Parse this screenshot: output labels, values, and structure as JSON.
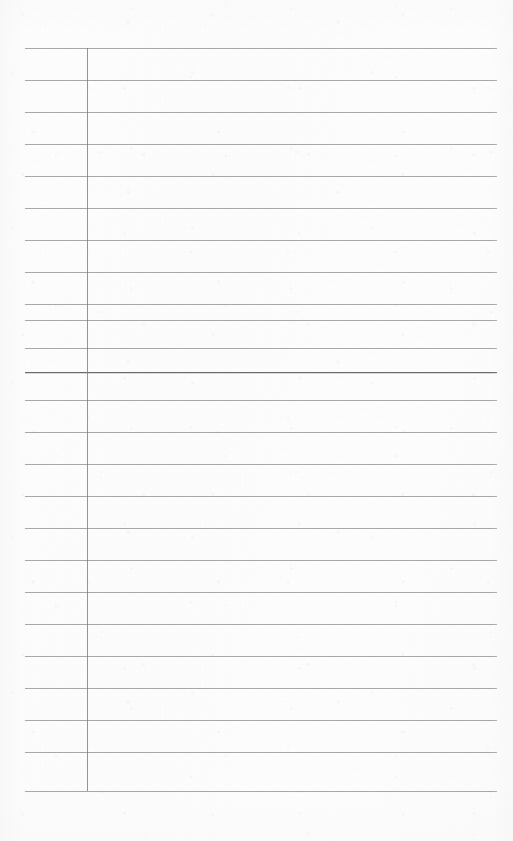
{
  "document": {
    "kind": "lined-ledger-page",
    "title": "",
    "content_text": "",
    "page_width": 513,
    "page_height": 841,
    "background_color": "#fdfdfd"
  },
  "ruling": {
    "line_color": "#84868c",
    "heavy_line_color": "#606268",
    "margin_rule_color": "#787a80",
    "line_spacing": 32,
    "first_line_y": 48,
    "left_x": 25,
    "right_x": 497,
    "margin_rule_x": 87,
    "margin_rule_top": 48,
    "margin_rule_bottom": 791,
    "heavy_line_index": 11,
    "line_count": 24,
    "horizontal_lines": [
      {
        "index": 0,
        "y": 48,
        "weight": "standard",
        "x1": 25,
        "x2": 497
      },
      {
        "index": 1,
        "y": 80,
        "weight": "standard",
        "x1": 25,
        "x2": 497
      },
      {
        "index": 2,
        "y": 112,
        "weight": "standard",
        "x1": 25,
        "x2": 497
      },
      {
        "index": 3,
        "y": 144,
        "weight": "standard",
        "x1": 25,
        "x2": 497
      },
      {
        "index": 4,
        "y": 176,
        "weight": "standard",
        "x1": 25,
        "x2": 497
      },
      {
        "index": 5,
        "y": 208,
        "weight": "standard",
        "x1": 25,
        "x2": 497
      },
      {
        "index": 6,
        "y": 240,
        "weight": "standard",
        "x1": 25,
        "x2": 497
      },
      {
        "index": 7,
        "y": 272,
        "weight": "standard",
        "x1": 25,
        "x2": 497
      },
      {
        "index": 8,
        "y": 304,
        "weight": "standard",
        "x1": 25,
        "x2": 497
      },
      {
        "index": 9,
        "y": 320,
        "weight": "standard",
        "x1": 25,
        "x2": 497
      },
      {
        "index": 10,
        "y": 348,
        "weight": "standard",
        "x1": 25,
        "x2": 497
      },
      {
        "index": 11,
        "y": 372,
        "weight": "heavy",
        "x1": 25,
        "x2": 497
      },
      {
        "index": 12,
        "y": 400,
        "weight": "standard",
        "x1": 25,
        "x2": 497
      },
      {
        "index": 13,
        "y": 432,
        "weight": "standard",
        "x1": 25,
        "x2": 497
      },
      {
        "index": 14,
        "y": 464,
        "weight": "standard",
        "x1": 25,
        "x2": 497
      },
      {
        "index": 15,
        "y": 496,
        "weight": "standard",
        "x1": 25,
        "x2": 497
      },
      {
        "index": 16,
        "y": 528,
        "weight": "standard",
        "x1": 25,
        "x2": 497
      },
      {
        "index": 17,
        "y": 560,
        "weight": "standard",
        "x1": 25,
        "x2": 497
      },
      {
        "index": 18,
        "y": 592,
        "weight": "standard",
        "x1": 25,
        "x2": 497
      },
      {
        "index": 19,
        "y": 624,
        "weight": "standard",
        "x1": 25,
        "x2": 497
      },
      {
        "index": 20,
        "y": 656,
        "weight": "standard",
        "x1": 25,
        "x2": 497
      },
      {
        "index": 21,
        "y": 688,
        "weight": "standard",
        "x1": 25,
        "x2": 497
      },
      {
        "index": 22,
        "y": 720,
        "weight": "standard",
        "x1": 25,
        "x2": 497
      },
      {
        "index": 23,
        "y": 752,
        "weight": "standard",
        "x1": 25,
        "x2": 497
      },
      {
        "index": 24,
        "y": 791,
        "weight": "standard",
        "x1": 25,
        "x2": 497
      }
    ]
  },
  "rows": [
    {
      "index": 0,
      "label_cell": "",
      "content_cell": ""
    },
    {
      "index": 1,
      "label_cell": "",
      "content_cell": ""
    },
    {
      "index": 2,
      "label_cell": "",
      "content_cell": ""
    },
    {
      "index": 3,
      "label_cell": "",
      "content_cell": ""
    },
    {
      "index": 4,
      "label_cell": "",
      "content_cell": ""
    },
    {
      "index": 5,
      "label_cell": "",
      "content_cell": ""
    },
    {
      "index": 6,
      "label_cell": "",
      "content_cell": ""
    },
    {
      "index": 7,
      "label_cell": "",
      "content_cell": ""
    },
    {
      "index": 8,
      "label_cell": "",
      "content_cell": ""
    },
    {
      "index": 9,
      "label_cell": "",
      "content_cell": ""
    },
    {
      "index": 10,
      "label_cell": "",
      "content_cell": ""
    },
    {
      "index": 11,
      "label_cell": "",
      "content_cell": ""
    },
    {
      "index": 12,
      "label_cell": "",
      "content_cell": ""
    },
    {
      "index": 13,
      "label_cell": "",
      "content_cell": ""
    },
    {
      "index": 14,
      "label_cell": "",
      "content_cell": ""
    },
    {
      "index": 15,
      "label_cell": "",
      "content_cell": ""
    },
    {
      "index": 16,
      "label_cell": "",
      "content_cell": ""
    },
    {
      "index": 17,
      "label_cell": "",
      "content_cell": ""
    },
    {
      "index": 18,
      "label_cell": "",
      "content_cell": ""
    },
    {
      "index": 19,
      "label_cell": "",
      "content_cell": ""
    },
    {
      "index": 20,
      "label_cell": "",
      "content_cell": ""
    },
    {
      "index": 21,
      "label_cell": "",
      "content_cell": ""
    },
    {
      "index": 22,
      "label_cell": "",
      "content_cell": ""
    },
    {
      "index": 23,
      "label_cell": "",
      "content_cell": ""
    }
  ]
}
